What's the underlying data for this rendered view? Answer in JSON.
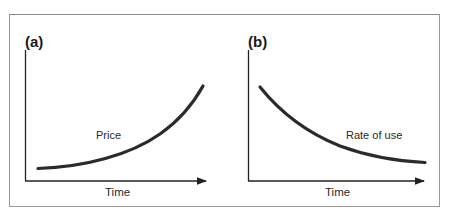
{
  "panels": [
    {
      "id": "a",
      "label": "(a)",
      "curve_label": "Price",
      "x_axis_label": "Time"
    },
    {
      "id": "b",
      "label": "(b)",
      "curve_label": "Rate of use",
      "x_axis_label": "Time"
    }
  ],
  "colors": {
    "frame": "#9a9a9a",
    "axis": "#222222",
    "curve": "#2b2b2b"
  }
}
